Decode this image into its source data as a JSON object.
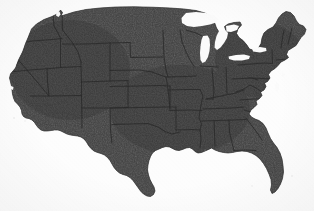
{
  "figure": {
    "kind": "map",
    "title": "",
    "caption": "",
    "labels_visible": false,
    "legend_visible": false,
    "projection_look": "albers-usa-like"
  },
  "colors": {
    "background": "#fdfdfd",
    "land_fill": "#3d3d3d",
    "land_fill_dark": "#343434",
    "state_border": "#2a2a2a",
    "outer_border": "#333333",
    "water_cutout": "#fbfbfb"
  },
  "geography": {
    "water_bodies": [
      {
        "name": "Lake Superior",
        "rendered": true
      },
      {
        "name": "Lake Michigan",
        "rendered": true
      },
      {
        "name": "Lake Huron",
        "rendered": true
      },
      {
        "name": "Lake Erie",
        "rendered": true
      },
      {
        "name": "Lake Ontario",
        "rendered": true
      },
      {
        "name": "Chesapeake Bay",
        "rendered": true
      },
      {
        "name": "Puget Sound",
        "rendered": true
      },
      {
        "name": "Gulf of Mexico",
        "rendered": true
      },
      {
        "name": "Great Salt Lake",
        "rendered": false
      }
    ],
    "notable_features": [
      {
        "name": "Florida Peninsula",
        "rendered": true
      },
      {
        "name": "Michigan Upper Peninsula",
        "rendered": true
      },
      {
        "name": "Michigan Lower Peninsula",
        "rendered": true
      },
      {
        "name": "Cape Cod",
        "rendered": true
      },
      {
        "name": "Maine Northeast Tip",
        "rendered": true
      },
      {
        "name": "Texas Gulf Coast",
        "rendered": true
      },
      {
        "name": "California Coastline",
        "rendered": true
      },
      {
        "name": "Delmarva Peninsula",
        "rendered": true
      }
    ],
    "state_borders_visible": true,
    "state_count_drawn": 48,
    "regions": [
      "Pacific Northwest",
      "West",
      "Southwest",
      "Mountain West",
      "Great Plains",
      "Midwest",
      "Great Lakes",
      "Northeast",
      "New England",
      "Mid-Atlantic",
      "South",
      "Gulf Coast"
    ]
  },
  "canvas": {
    "width": 314,
    "height": 211
  }
}
